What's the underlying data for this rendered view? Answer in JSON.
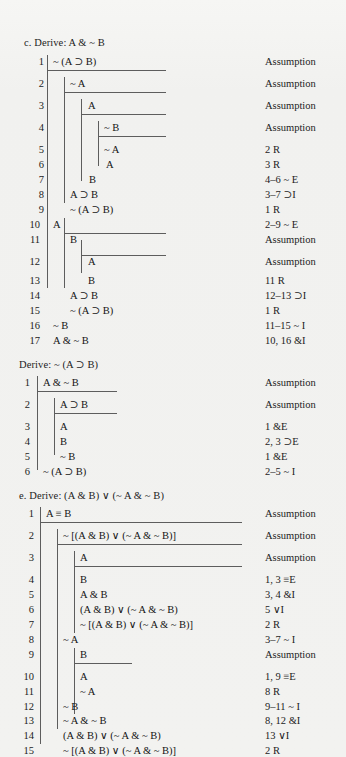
{
  "page": {
    "background": "#f2f2f0",
    "ink": "#1a1a1a",
    "rule_color": "#5d5d5d"
  },
  "proofs": [
    {
      "id": "proof-c",
      "heading": "c. Derive: A & ~ B",
      "lines": [
        {
          "n": "1",
          "formula": "~ (A ⊃ B)",
          "justification": "Assumption"
        },
        {
          "n": "2",
          "formula": "~ A",
          "justification": "Assumption"
        },
        {
          "n": "3",
          "formula": "A",
          "justification": "Assumption"
        },
        {
          "n": "4",
          "formula": "~ B",
          "justification": "Assumption"
        },
        {
          "n": "5",
          "formula": "~ A",
          "justification": "2 R"
        },
        {
          "n": "6",
          "formula": "A",
          "justification": "3 R"
        },
        {
          "n": "7",
          "formula": "B",
          "justification": "4–6 ~ E"
        },
        {
          "n": "8",
          "formula": "A ⊃ B",
          "justification": "3–7 ⊃I"
        },
        {
          "n": "9",
          "formula": "~ (A ⊃ B)",
          "justification": "1 R"
        },
        {
          "n": "10",
          "formula": "A",
          "justification": "2–9 ~ E"
        },
        {
          "n": "11",
          "formula": "B",
          "justification": "Assumption"
        },
        {
          "n": "12",
          "formula": "A",
          "justification": "Assumption"
        },
        {
          "n": "13",
          "formula": "B",
          "justification": "11 R"
        },
        {
          "n": "14",
          "formula": "A ⊃ B",
          "justification": "12–13 ⊃I"
        },
        {
          "n": "15",
          "formula": "~ (A ⊃ B)",
          "justification": "1 R"
        },
        {
          "n": "16",
          "formula": "~ B",
          "justification": "11–15 ~ I"
        },
        {
          "n": "17",
          "formula": "A & ~ B",
          "justification": "10, 16 &I"
        }
      ]
    },
    {
      "id": "proof-d",
      "heading": "Derive: ~ (A ⊃ B)",
      "lines": [
        {
          "n": "1",
          "formula": "A & ~ B",
          "justification": "Assumption"
        },
        {
          "n": "2",
          "formula": "A ⊃ B",
          "justification": "Assumption"
        },
        {
          "n": "3",
          "formula": "A",
          "justification": "1 &E"
        },
        {
          "n": "4",
          "formula": "B",
          "justification": "2, 3 ⊃E"
        },
        {
          "n": "5",
          "formula": "~ B",
          "justification": "1 &E"
        },
        {
          "n": "6",
          "formula": "~ (A ⊃ B)",
          "justification": "2–5 ~ I"
        }
      ]
    },
    {
      "id": "proof-e",
      "heading": "e. Derive: (A & B) ∨ (~ A & ~ B)",
      "lines": [
        {
          "n": "1",
          "formula": "A ≡ B",
          "justification": "Assumption"
        },
        {
          "n": "2",
          "formula": "~ [(A & B) ∨ (~ A & ~ B)]",
          "justification": "Assumption"
        },
        {
          "n": "3",
          "formula": "A",
          "justification": "Assumption"
        },
        {
          "n": "4",
          "formula": "B",
          "justification": "1, 3 ≡E"
        },
        {
          "n": "5",
          "formula": "A & B",
          "justification": "3, 4 &I"
        },
        {
          "n": "6",
          "formula": "(A & B) ∨ (~ A & ~ B)",
          "justification": "5 ∨I"
        },
        {
          "n": "7",
          "formula": "~ [(A & B) ∨ (~ A & ~ B)]",
          "justification": "2 R"
        },
        {
          "n": "8",
          "formula": "~ A",
          "justification": "3–7 ~ I"
        },
        {
          "n": "9",
          "formula": "B",
          "justification": "Assumption"
        },
        {
          "n": "10",
          "formula": "A",
          "justification": "1, 9 ≡E"
        },
        {
          "n": "11",
          "formula": "~ A",
          "justification": "8 R"
        },
        {
          "n": "12",
          "formula": "~ B",
          "justification": "9–11 ~ I"
        },
        {
          "n": "13",
          "formula": "~ A & ~ B",
          "justification": "8, 12 &I"
        },
        {
          "n": "14",
          "formula": "(A & B) ∨ (~ A & ~ B)",
          "justification": "13 ∨I"
        },
        {
          "n": "15",
          "formula": "~ [(A & B) ∨ (~ A & ~ B)]",
          "justification": "2 R"
        },
        {
          "n": "16",
          "formula": "(A & B) ∨ (~ A & ~ B)",
          "justification": "2–15 ~ E"
        }
      ]
    }
  ]
}
